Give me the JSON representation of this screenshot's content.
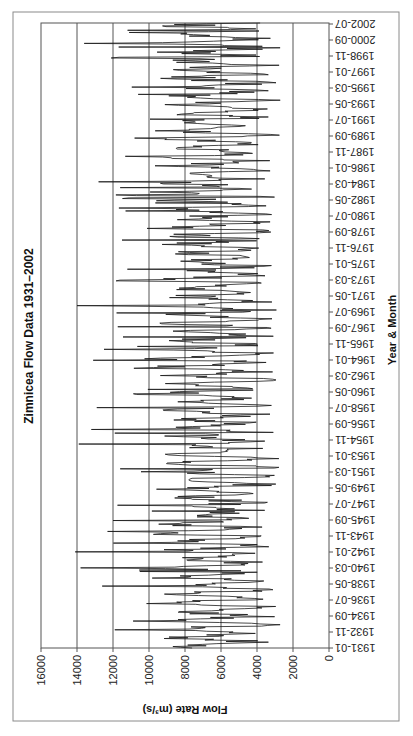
{
  "chart_data": {
    "type": "line",
    "title": "Zimnicea Flow Data 1931–2002",
    "xlabel": "Year & Month",
    "ylabel": "Flow Rate (m³/s)",
    "ylim": [
      0,
      16000
    ],
    "y_ticks": [
      0,
      2000,
      4000,
      6000,
      8000,
      10000,
      12000,
      14000,
      16000
    ],
    "x_tick_labels": [
      "1931-01",
      "1932-11",
      "1934-09",
      "1936-07",
      "1938-05",
      "1940-03",
      "1942-01",
      "1943-11",
      "1945-09",
      "1947-07",
      "1949-05",
      "1951-03",
      "1953-01",
      "1954-11",
      "1956-09",
      "1958-07",
      "1960-05",
      "1962-03",
      "1964-01",
      "1965-11",
      "1967-09",
      "1969-07",
      "1971-05",
      "1973-03",
      "1975-01",
      "1976-11",
      "1978-09",
      "1980-07",
      "1982-05",
      "1984-03",
      "1986-01",
      "1987-11",
      "1989-09",
      "1991-07",
      "1993-05",
      "1995-03",
      "1997-01",
      "1998-11",
      "2000-09",
      "2002-07"
    ],
    "grid": "horizontal major gridlines every 2000",
    "legend": "none",
    "orientation_note": "chart image rotated 90 degrees (time axis runs vertically from bottom 1931-01 to top 2002-07; flow axis horizontal with 0 at right, 16000 at left)",
    "series": [
      {
        "name": "Flow Rate",
        "color": "#1a1a1a",
        "approx_summary": "monthly series 1931-01 to 2002-07 (~859 points); typical range 3000-9000 m3/s; peaks ~13800-14200 around 1940-03, 1942-01, 1970; ~13000-14000 spikes near 1955, 1999-2000; minima ~1800-2500 around 1947, 1953, 1990s"
      }
    ]
  },
  "labels": {
    "title": "Zimnicea Flow Data 1931–2002",
    "xlabel": "Year & Month",
    "ylabel": "Flow Rate (m³/s)"
  }
}
